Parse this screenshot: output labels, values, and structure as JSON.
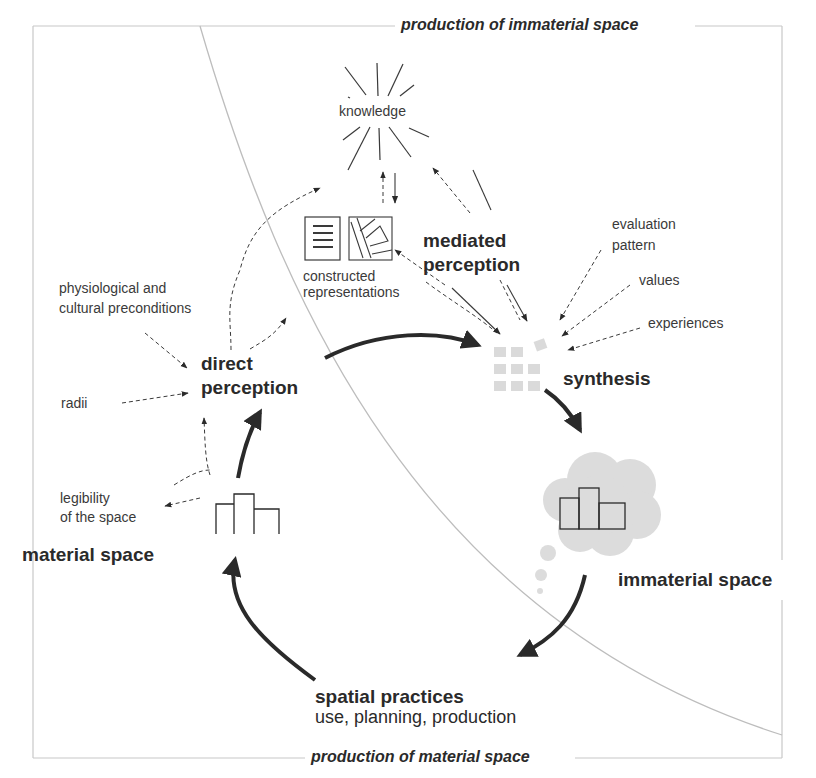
{
  "frame": {
    "top_label": "production of immaterial space",
    "bottom_label": "production of material space"
  },
  "nodes": {
    "knowledge": "knowledge",
    "constructed_representations": [
      "constructed",
      "representations"
    ],
    "mediated_perception": [
      "mediated",
      "perception"
    ],
    "evaluation_pattern": [
      "evaluation",
      "pattern"
    ],
    "values": "values",
    "experiences": "experiences",
    "physiological": [
      "physiological and",
      "cultural preconditions"
    ],
    "direct_perception": [
      "direct",
      "perception"
    ],
    "radii": "radii",
    "synthesis": "synthesis",
    "legibility": [
      "legibility",
      "of the space"
    ],
    "material_space": "material space",
    "immaterial_space": "immaterial space",
    "spatial_practices": "spatial practices",
    "spatial_practices_sub": "use, planning, production"
  },
  "icons": [
    "knowledge-burst-icon",
    "text-document-icon",
    "map-icon",
    "synthesis-grid-icon",
    "building-icon",
    "thought-cloud-building-icon"
  ],
  "colors": {
    "ink": "#2a2a2a",
    "frame": "#c8c8c8",
    "cloud": "#dcdcdc",
    "grid": "#d8d8d8"
  }
}
